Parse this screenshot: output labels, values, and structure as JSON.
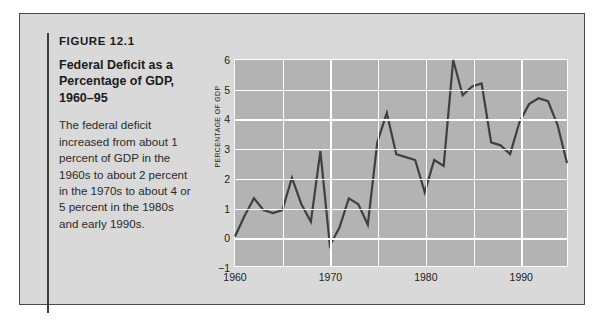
{
  "figure": {
    "number": "FIGURE 12.1",
    "title": "Federal Deficit as a Percentage of GDP, 1960–95",
    "description": "The federal deficit increased from about 1 percent of GDP in the 1960s to about 2 percent in the 1970s to about 4 or 5 percent in the 1980s and early 1990s."
  },
  "colors": {
    "panel_background": "#d9d9d9",
    "panel_border": "#4a4a4a",
    "plot_area": "#b3b3b3",
    "gridlines": "#ffffff",
    "series_line": "#3f3f3f",
    "text": "#1c1c1c"
  },
  "chart_data": {
    "type": "line",
    "title": "",
    "xlabel": "",
    "ylabel": "PERCENTAGE OF GDP",
    "xlim": [
      1960,
      1995
    ],
    "ylim": [
      -1,
      6
    ],
    "yticks": [
      6,
      5,
      4,
      3,
      2,
      1,
      0,
      "−1"
    ],
    "ytick_values": [
      6,
      5,
      4,
      3,
      2,
      1,
      0,
      -1
    ],
    "xticks": [
      "1960",
      "1970",
      "1980",
      "1990"
    ],
    "xtick_values": [
      1960,
      1970,
      1980,
      1990
    ],
    "xgrid_values": [
      1965,
      1970,
      1975,
      1980,
      1985,
      1990,
      1995
    ],
    "grid": true,
    "legend": false,
    "series": [
      {
        "name": "Federal deficit as a percentage of GDP",
        "x": [
          1960,
          1961,
          1962,
          1963,
          1964,
          1965,
          1966,
          1967,
          1968,
          1969,
          1970,
          1971,
          1972,
          1973,
          1974,
          1975,
          1976,
          1977,
          1978,
          1979,
          1980,
          1981,
          1982,
          1983,
          1984,
          1985,
          1986,
          1987,
          1988,
          1989,
          1990,
          1991,
          1992,
          1993,
          1994,
          1995
        ],
        "values": [
          0.0,
          0.7,
          1.3,
          0.9,
          0.8,
          0.9,
          2.0,
          1.1,
          0.5,
          2.9,
          -0.3,
          0.3,
          1.3,
          1.1,
          0.4,
          3.2,
          4.2,
          2.8,
          2.7,
          2.6,
          1.5,
          2.6,
          2.4,
          6.0,
          4.8,
          5.1,
          5.2,
          3.2,
          3.1,
          2.8,
          3.9,
          4.5,
          4.7,
          4.6,
          3.8,
          2.5
        ]
      }
    ]
  }
}
